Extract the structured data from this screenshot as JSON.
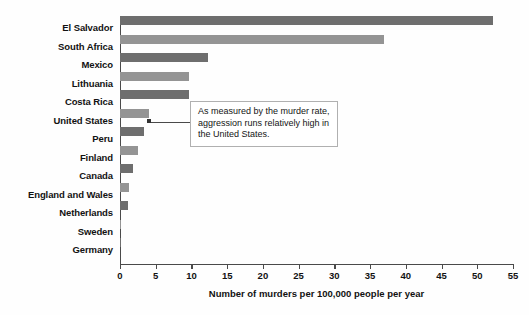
{
  "chart_data": {
    "type": "bar",
    "orientation": "horizontal",
    "title": "",
    "xlabel": "Number of murders per 100,000 people per year",
    "ylabel": "",
    "xlim": [
      0,
      55
    ],
    "xticks": [
      0,
      5,
      10,
      15,
      20,
      25,
      30,
      35,
      40,
      45,
      50,
      55
    ],
    "grid": false,
    "legend": "none",
    "categories": [
      "El Salvador",
      "South Africa",
      "Mexico",
      "Lithuania",
      "Costa Rica",
      "United States",
      "Peru",
      "Finland",
      "Canada",
      "England and Wales",
      "Netherlands",
      "Sweden",
      "Germany"
    ],
    "values": [
      52.2,
      37.0,
      12.3,
      9.7,
      9.7,
      4.1,
      3.4,
      2.5,
      1.8,
      1.2,
      1.1,
      0.1,
      0.1
    ],
    "bar_colors": [
      "#6e6e6e",
      "#949494",
      "#6e6e6e",
      "#949494",
      "#6e6e6e",
      "#949494",
      "#6e6e6e",
      "#949494",
      "#6e6e6e",
      "#949494",
      "#6e6e6e",
      "#949494",
      "#6e6e6e"
    ],
    "annotations": [
      {
        "text": "As measured by the murder rate, aggression runs relatively high in the United States.",
        "points_at": "United States"
      }
    ]
  },
  "colors": {
    "axis": "#4a4a4a",
    "text": "#121212",
    "callout_border": "#b0b0b0",
    "background": "#fefefe"
  }
}
